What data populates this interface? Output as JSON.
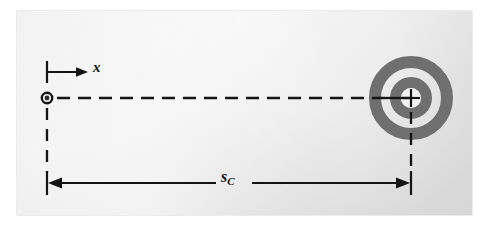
{
  "figure": {
    "kind": "physics-kinematics-diagram",
    "panel": {
      "background_light": "#f4f4f4",
      "background_dark": "#dedede",
      "left": 17,
      "top": 11,
      "width": 455,
      "height": 204
    },
    "ink_color": "#141414",
    "ring_color": "#6f6f6f"
  },
  "labels": {
    "axis_x": "x",
    "distance_symbol": "s",
    "distance_subscript": "C"
  },
  "elements": {
    "particle": {
      "name": "particle-marker",
      "cx": 47,
      "cy": 98,
      "outer_r": 6.2,
      "inner_r": 3.0
    },
    "target": {
      "name": "bullseye-target",
      "cx": 411,
      "cy": 98,
      "outer_r": 42,
      "ring_outer_band": 12,
      "white_gap": 9,
      "ring_inner_band": 11,
      "center_white_r": 10
    },
    "axis_indicator": {
      "tick_x": 47,
      "tick_top": 62,
      "tick_bottom": 82,
      "arrow_y": 72,
      "arrow_from": 47,
      "arrow_to": 86
    },
    "path_line": {
      "y": 98,
      "from": 56,
      "to": 411,
      "style": "dashed",
      "dash": "13 8"
    },
    "extension_left": {
      "x": 47,
      "from_y": 108,
      "to_y": 191,
      "style": "dashed"
    },
    "extension_right": {
      "x": 411,
      "from_y": 98,
      "to_y": 191,
      "style": "dashed"
    },
    "dimension_line": {
      "y": 183,
      "from": 47,
      "to": 411,
      "arrows": "both",
      "tick_half_height": 12
    }
  }
}
